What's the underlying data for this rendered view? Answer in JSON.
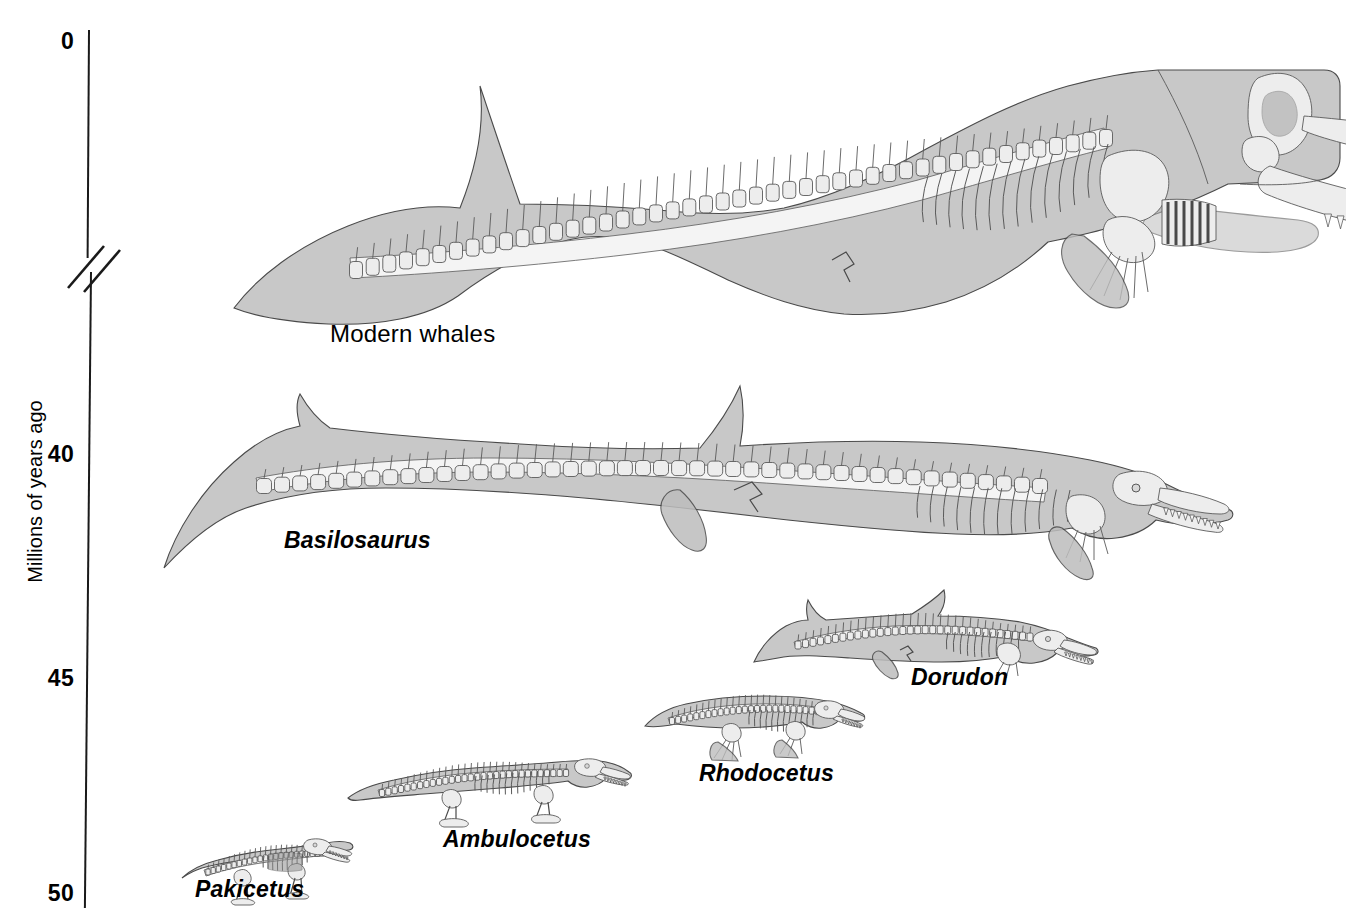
{
  "figure": {
    "kind": "whale-evolution-timeline",
    "background_color": "#ffffff",
    "body_fill_color": "#c8c8c8",
    "bone_fill_color": "#ededed",
    "outline_color": "#4a4a4a"
  },
  "axis": {
    "title": "Millions of years ago",
    "orientation": "vertical",
    "has_break": true,
    "break_note": "double-slash break between 0 and 40",
    "ticks": [
      {
        "label": "0",
        "value": 0
      },
      {
        "label": "40",
        "value": 40
      },
      {
        "label": "45",
        "value": 45
      },
      {
        "label": "50",
        "value": 50
      }
    ]
  },
  "organisms": [
    {
      "name": "Modern whales",
      "italic": false,
      "age_ma": 0,
      "relative_size": "largest"
    },
    {
      "name": "Basilosaurus",
      "italic": true,
      "age_ma": 40,
      "relative_size": "very-large"
    },
    {
      "name": "Dorudon",
      "italic": true,
      "age_ma": 44,
      "relative_size": "medium"
    },
    {
      "name": "Rhodocetus",
      "italic": true,
      "age_ma": 46.5,
      "relative_size": "small"
    },
    {
      "name": "Ambulocetus",
      "italic": true,
      "age_ma": 48,
      "relative_size": "small"
    },
    {
      "name": "Pakicetus",
      "italic": true,
      "age_ma": 50,
      "relative_size": "smallest"
    }
  ],
  "chart_data": {
    "type": "scatter",
    "title": "",
    "xlabel": "",
    "ylabel": "Millions of years ago",
    "ylim": [
      50,
      0
    ],
    "y_ticks": [
      0,
      40,
      45,
      50
    ],
    "y_axis_broken_between": [
      0,
      40
    ],
    "grid": false,
    "legend": "none",
    "categories": [
      "Pakicetus",
      "Ambulocetus",
      "Rhodocetus",
      "Dorudon",
      "Basilosaurus",
      "Modern whales"
    ],
    "values": [
      50,
      48,
      46.5,
      44,
      40,
      0
    ],
    "annotations": [
      "Pakicetus",
      "Ambulocetus",
      "Rhodocetus",
      "Dorudon",
      "Basilosaurus",
      "Modern whales"
    ]
  }
}
